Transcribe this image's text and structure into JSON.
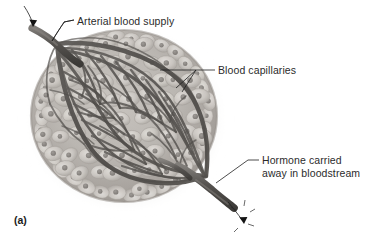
{
  "figure": {
    "caption": "(a)",
    "background_color": "#ffffff"
  },
  "labels": [
    {
      "id": "arterial-blood-supply",
      "text": "Arterial blood supply",
      "lines": [
        "Arterial blood supply"
      ],
      "x": 77,
      "y": 22,
      "anchor": "start"
    },
    {
      "id": "blood-capillaries",
      "text": "Blood capillaries",
      "lines": [
        "Blood capillaries"
      ],
      "x": 218,
      "y": 72,
      "anchor": "start"
    },
    {
      "id": "hormone-carried-away",
      "text": "Hormone carried away in bloodstream",
      "lines": [
        "Hormone carried",
        "away in bloodstream"
      ],
      "x": 262,
      "y": 163,
      "anchor": "start"
    }
  ],
  "arrows": [
    {
      "id": "inflow-arrow",
      "name": "arterial-inflow-arrow",
      "direction": "down-right",
      "location": "top-left"
    },
    {
      "id": "outflow-arrow",
      "name": "hormone-outflow-arrow",
      "direction": "down-right",
      "location": "bottom-right"
    }
  ],
  "colors": {
    "gland_tissue": "#b9b5b0",
    "gland_rim": "#a29d98",
    "cell_body": "#cdc9c4",
    "cell_nucleus": "#8e8a86",
    "vessel_dark": "#4a4845",
    "vessel_mid": "#6b6864",
    "vessel_light": "#8e8b87",
    "label_text": "#2b2b2b",
    "leader_line": "#1f1f1f",
    "background": "#ffffff",
    "shadow": "#d9d6d2"
  },
  "structure": {
    "afferent_vessel": "arteriole entering at upper left",
    "efferent_vessel": "vein exiting at lower right",
    "plexus_shape": "lens-shaped anastomosing capillary network",
    "cell_count_visual": "numerous rounded secretory cells with nuclei"
  }
}
